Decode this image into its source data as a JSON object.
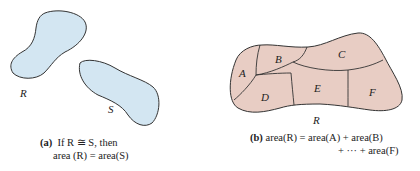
{
  "colors": {
    "left_fill": "#d3e6f2",
    "right_fill": "#e8cdc4",
    "stroke": "#333333"
  },
  "panel_a": {
    "shape_labels": {
      "r": "R",
      "s": "S"
    },
    "caption": {
      "tag": "(a)",
      "line1": "If R ≅ S, then",
      "line2": "area (R) = area(S)"
    }
  },
  "panel_b": {
    "region_label": "R",
    "subregions": [
      "A",
      "B",
      "C",
      "D",
      "E",
      "F"
    ],
    "caption": {
      "tag": "(b)",
      "line1": "area(R) = area(A) + area(B)",
      "line2": "+ ··· + area(F)"
    }
  }
}
